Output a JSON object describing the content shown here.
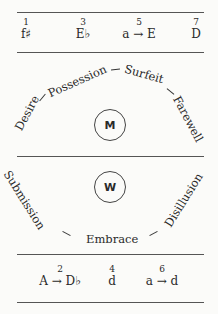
{
  "top_table": {
    "cells": [
      {
        "num": "1",
        "key": "f♯"
      },
      {
        "num": "3",
        "key": "E♭"
      },
      {
        "num": "5",
        "key": "a → E"
      },
      {
        "num": "7",
        "key": "D"
      }
    ]
  },
  "m_arc": {
    "center_label": "M",
    "words": [
      "Desire",
      "Possession",
      "Surfeit",
      "Farewell"
    ]
  },
  "w_arc": {
    "center_label": "W",
    "words": [
      "Submission",
      "Embrace",
      "Disillusion"
    ]
  },
  "bottom_table": {
    "cells": [
      {
        "num": "2",
        "key": "A → D♭"
      },
      {
        "num": "4",
        "key": "d"
      },
      {
        "num": "6",
        "key": "a → d"
      }
    ]
  }
}
